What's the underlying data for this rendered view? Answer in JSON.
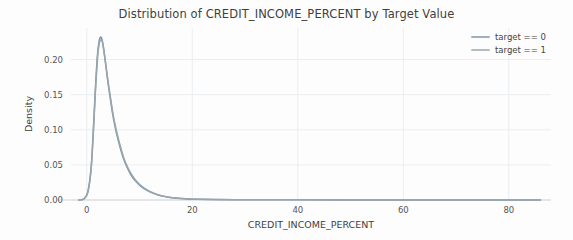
{
  "chart_data": {
    "type": "line",
    "title": "Distribution of CREDIT_INCOME_PERCENT by Target Value",
    "xlabel": "CREDIT_INCOME_PERCENT",
    "ylabel": "Density",
    "xlim": [
      -3,
      88
    ],
    "ylim": [
      0,
      0.245
    ],
    "xticks": [
      0,
      20,
      40,
      60,
      80
    ],
    "xtick_labels": [
      "0",
      "20",
      "40",
      "60",
      "80"
    ],
    "yticks": [
      0.0,
      0.05,
      0.1,
      0.15,
      0.2
    ],
    "ytick_labels": [
      "0.00",
      "0.05",
      "0.10",
      "0.15",
      "0.20"
    ],
    "grid": true,
    "legend_position": "upper right",
    "series": [
      {
        "name": "target == 0",
        "color": "#7f94a8",
        "x": [
          -1.5,
          -0.5,
          0.2,
          0.8,
          1.2,
          1.6,
          2.0,
          2.3,
          2.6,
          2.9,
          3.2,
          3.6,
          4.0,
          4.5,
          5.0,
          5.6,
          6.2,
          7.0,
          7.8,
          8.6,
          9.5,
          10.5,
          11.5,
          12.5,
          13.5,
          14.5,
          15.5,
          17.0,
          19.0,
          21.0,
          24.0,
          28.0,
          33.0,
          40.0,
          50.0,
          62.0,
          75.0,
          86.0
        ],
        "y": [
          0.0,
          0.002,
          0.012,
          0.045,
          0.095,
          0.155,
          0.205,
          0.225,
          0.232,
          0.228,
          0.215,
          0.192,
          0.168,
          0.142,
          0.118,
          0.096,
          0.078,
          0.058,
          0.044,
          0.033,
          0.025,
          0.018,
          0.0135,
          0.0098,
          0.0072,
          0.0052,
          0.0038,
          0.0025,
          0.0016,
          0.0011,
          0.0007,
          0.0005,
          0.0003,
          0.0002,
          0.0001,
          5e-05,
          2e-05,
          0.0
        ]
      },
      {
        "name": "target == 1",
        "color": "#9aa6ad",
        "x": [
          -1.5,
          -0.5,
          0.2,
          0.8,
          1.2,
          1.6,
          2.0,
          2.3,
          2.6,
          2.9,
          3.2,
          3.6,
          4.0,
          4.5,
          5.0,
          5.6,
          6.2,
          7.0,
          7.8,
          8.6,
          9.5,
          10.5,
          11.5,
          12.5,
          13.5,
          14.5,
          15.5,
          17.0,
          19.0,
          21.0,
          24.0,
          28.0,
          33.0,
          40.0,
          50.0,
          62.0,
          75.0,
          86.0
        ],
        "y": [
          0.0,
          0.0018,
          0.011,
          0.042,
          0.09,
          0.15,
          0.2,
          0.221,
          0.228,
          0.226,
          0.214,
          0.193,
          0.17,
          0.145,
          0.121,
          0.099,
          0.081,
          0.06,
          0.046,
          0.035,
          0.026,
          0.019,
          0.0142,
          0.0104,
          0.0076,
          0.0055,
          0.004,
          0.0027,
          0.0017,
          0.0012,
          0.0008,
          0.0005,
          0.0003,
          0.0002,
          0.0001,
          5e-05,
          2e-05,
          0.0
        ]
      }
    ]
  },
  "legend": {
    "entries": [
      {
        "label": "target == 0",
        "color": "#7f94a8"
      },
      {
        "label": "target == 1",
        "color": "#9aa6ad"
      }
    ]
  }
}
